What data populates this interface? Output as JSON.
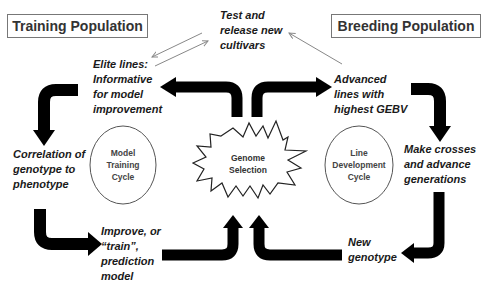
{
  "title_boxes": {
    "training": "Training Population",
    "breeding": "Breeding Population"
  },
  "labels": {
    "release": [
      "Test and",
      "release new",
      "cultivars"
    ],
    "elite": [
      "Elite lines:",
      "Informative",
      "for model",
      "improvement"
    ],
    "advanced": [
      "Advanced",
      "lines with",
      "highest GEBV"
    ],
    "correlation": [
      "Correlation of",
      "genotype to",
      "phenotype"
    ],
    "crosses": [
      "Make crosses",
      "and advance",
      "generations"
    ],
    "improve": [
      "Improve, or",
      "“train”,",
      "prediction",
      "model"
    ],
    "new_genotype": [
      "New",
      "genotype"
    ]
  },
  "cycles": {
    "model_training": [
      "Model",
      "Training",
      "Cycle"
    ],
    "line_development": [
      "Line",
      "Development",
      "Cycle"
    ]
  },
  "center": [
    "Genome",
    "Selection"
  ],
  "colors": {
    "arrow": "#000000",
    "thin_arrow": "#888888",
    "box_border": "#777777",
    "circle_border": "#555555",
    "text": "#1a1a1a"
  }
}
